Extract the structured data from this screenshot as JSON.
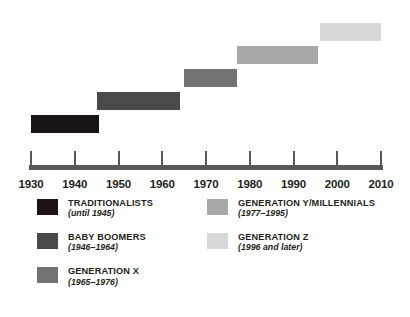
{
  "chart_data": {
    "type": "bar",
    "orientation": "horizontal-timeline",
    "title": "",
    "xlabel": "",
    "ylabel": "",
    "xlim": [
      1930,
      2010
    ],
    "grid": false,
    "legend_position": "bottom",
    "axis_ticks": [
      1930,
      1940,
      1950,
      1960,
      1970,
      1980,
      1990,
      2000,
      2010
    ],
    "tick_labels": [
      "1930",
      "1940",
      "1950",
      "1960",
      "1970",
      "1980",
      "1990",
      "2000",
      "2010"
    ],
    "categories": [
      "TRADITIONALISTS",
      "BABY BOOMERS",
      "GENERATION X",
      "GENERATION Y/MILLENNIALS",
      "GENERATION Z"
    ],
    "series": [
      {
        "name": "TRADITIONALISTS",
        "start": 1930,
        "end": 1945.5,
        "row": 0,
        "color": "#1a1414"
      },
      {
        "name": "BABY BOOMERS",
        "start": 1945.0,
        "end": 1964.0,
        "row": 1,
        "color": "#4a4a4a"
      },
      {
        "name": "GENERATION X",
        "start": 1965.0,
        "end": 1977.0,
        "row": 2,
        "color": "#737373"
      },
      {
        "name": "GENERATION Y/MILLENNIALS",
        "start": 1977.0,
        "end": 1995.5,
        "row": 3,
        "color": "#a8a8a8"
      },
      {
        "name": "GENERATION Z",
        "start": 1996.0,
        "end": 2010.0,
        "row": 4,
        "color": "#d8d8d8"
      }
    ]
  },
  "axis": {
    "line_color": "#58595b",
    "ticks": [
      {
        "label": "1930",
        "value": 1930
      },
      {
        "label": "1940",
        "value": 1940
      },
      {
        "label": "1950",
        "value": 1950
      },
      {
        "label": "1960",
        "value": 1960
      },
      {
        "label": "1970",
        "value": 1970
      },
      {
        "label": "1980",
        "value": 1980
      },
      {
        "label": "1990",
        "value": 1990
      },
      {
        "label": "2000",
        "value": 2000
      },
      {
        "label": "2010",
        "value": 2010
      }
    ]
  },
  "legend": {
    "columns": [
      {
        "items": [
          {
            "title": "TRADITIONALISTS",
            "years": "(until 1945)",
            "color": "#1a1414",
            "key": "traditionalists"
          },
          {
            "title": "BABY BOOMERS",
            "years": "(1946–1964)",
            "color": "#4a4a4a",
            "key": "baby-boomers"
          },
          {
            "title": "GENERATION X",
            "years": "(1965–1976)",
            "color": "#737373",
            "key": "generation-x"
          }
        ]
      },
      {
        "items": [
          {
            "title": "GENERATION Y/MILLENNIALS",
            "years": "(1977–1995)",
            "color": "#a8a8a8",
            "key": "generation-y"
          },
          {
            "title": "GENERATION Z",
            "years": "(1996 and later)",
            "color": "#d8d8d8",
            "key": "generation-z"
          }
        ]
      }
    ]
  },
  "colors": {
    "background": "#ffffff",
    "text": "#231f20",
    "axis": "#58595b"
  }
}
